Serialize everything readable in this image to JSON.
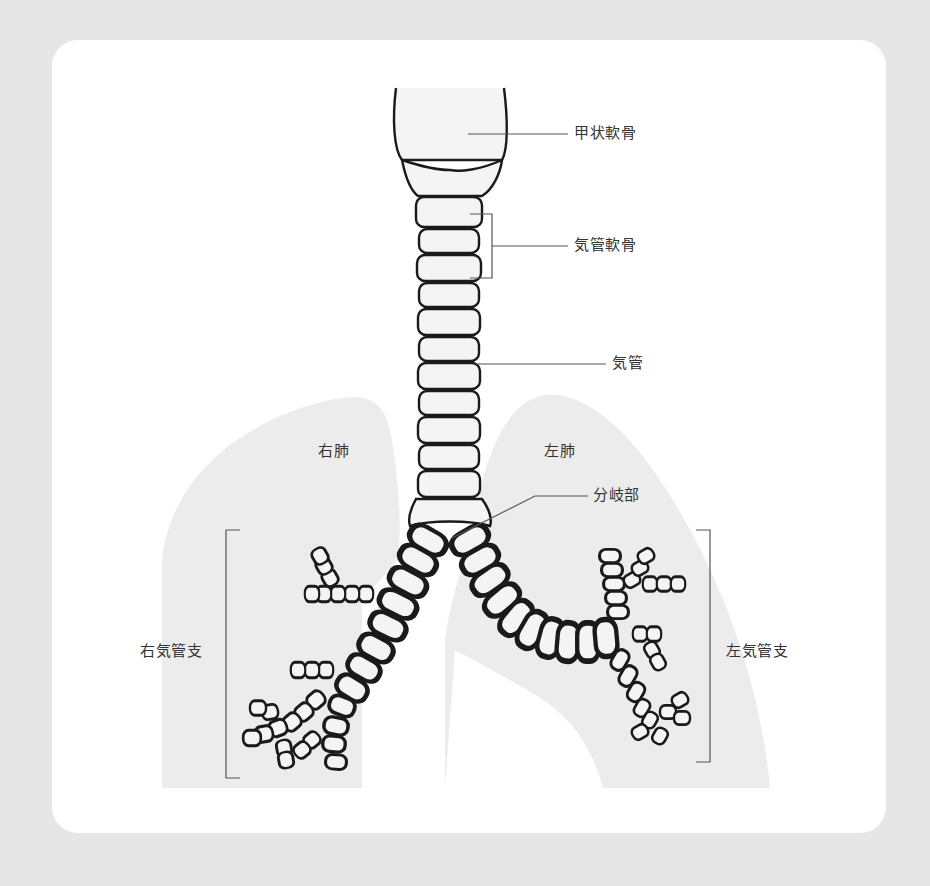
{
  "diagram": {
    "colors": {
      "page_background": "#e6e6e6",
      "card_background": "#ffffff",
      "lung_fill": "#ececec",
      "cartilage_fill": "#f4f4f4",
      "outline": "#1a1a1a",
      "leader_line": "#555555",
      "label_text": "#333333"
    },
    "labels": {
      "thyroid_cartilage": "甲状軟骨",
      "tracheal_cartilage": "気管軟骨",
      "trachea": "気管",
      "right_lung": "右肺",
      "left_lung": "左肺",
      "carina": "分岐部",
      "right_bronchus": "右気管支",
      "left_bronchus": "左気管支"
    }
  }
}
